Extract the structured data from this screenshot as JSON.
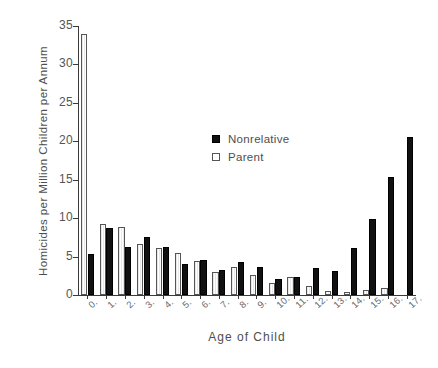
{
  "chart_data": {
    "type": "bar",
    "title": "",
    "xlabel": "Age of Child",
    "ylabel": "Homicides per Million Children per Annum",
    "categories": [
      "0.",
      "1.",
      "2.",
      "3.",
      "4.",
      "5.",
      "6.",
      "7.",
      "8.",
      "9.",
      "10.",
      "11.",
      "12.",
      "13.",
      "14.",
      "15.",
      "16.",
      "17."
    ],
    "ylim": [
      0,
      35
    ],
    "yticks": [
      0,
      5,
      10,
      15,
      20,
      25,
      30,
      35
    ],
    "ytick_labels": [
      "0",
      "5",
      "10",
      "15",
      "20",
      "25",
      "30",
      "35"
    ],
    "grid": false,
    "legend_position": "center",
    "series": [
      {
        "name": "Nonrelative",
        "color": "#111111",
        "values": [
          5.4,
          8.7,
          6.3,
          7.6,
          6.2,
          4.0,
          4.6,
          3.2,
          4.3,
          3.6,
          2.1,
          2.4,
          3.5,
          3.1,
          6.1,
          9.9,
          15.4,
          20.6
        ]
      },
      {
        "name": "Parent",
        "color": "#ffffff",
        "values": [
          34.0,
          9.2,
          8.8,
          6.7,
          6.1,
          5.5,
          4.4,
          3.0,
          3.6,
          2.6,
          1.5,
          2.3,
          1.2,
          0.5,
          0.4,
          0.7,
          0.9,
          0.0
        ]
      }
    ]
  },
  "legend": {
    "items": [
      {
        "label": "Nonrelative",
        "marker": "filled-square"
      },
      {
        "label": "Parent",
        "marker": "open-square"
      }
    ]
  }
}
